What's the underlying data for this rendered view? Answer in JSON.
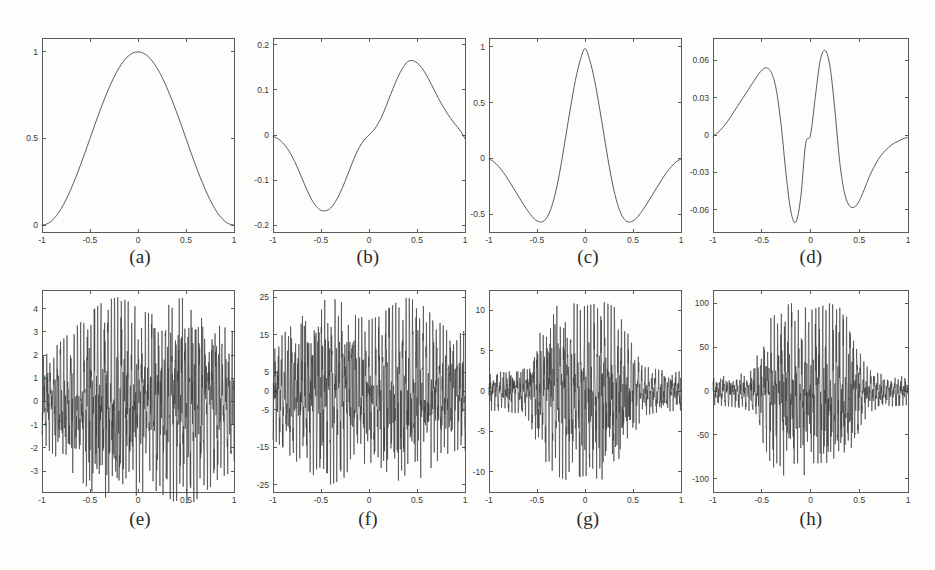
{
  "figure": {
    "background_color": "#fdfdfc",
    "axis_color": "#5a5a5a",
    "curve_color": "#4a4a4a",
    "noise_curve_color": "#3c3c3c"
  },
  "panels": [
    {
      "id": "a",
      "caption": "(a)"
    },
    {
      "id": "b",
      "caption": "(b)"
    },
    {
      "id": "c",
      "caption": "(c)"
    },
    {
      "id": "d",
      "caption": "(d)"
    },
    {
      "id": "e",
      "caption": "(e)"
    },
    {
      "id": "f",
      "caption": "(f)"
    },
    {
      "id": "g",
      "caption": "(g)"
    },
    {
      "id": "h",
      "caption": "(h)"
    }
  ],
  "chart_data": [
    {
      "panel": "a",
      "type": "line",
      "title": "(a)",
      "xlabel": "",
      "ylabel": "",
      "xlim": [
        -1,
        1
      ],
      "ylim": [
        -0.04,
        1.08
      ],
      "xticks": [
        -1,
        -0.5,
        0,
        0.5,
        1
      ],
      "xticklabels": [
        "-1",
        "-0.5",
        "0",
        "0.5",
        "1"
      ],
      "yticks": [
        0,
        0.5,
        1
      ],
      "yticklabels": [
        "0",
        "0.5",
        "1"
      ],
      "grid": false,
      "legend": null,
      "description": "smooth symmetric bell-shaped scaling function, value 0 at x=-1, rises to peak 1.0 at x=0, back to 0 at x=1",
      "x": [
        -1,
        -0.95,
        -0.9,
        -0.85,
        -0.8,
        -0.75,
        -0.7,
        -0.65,
        -0.6,
        -0.55,
        -0.5,
        -0.45,
        -0.4,
        -0.35,
        -0.3,
        -0.25,
        -0.2,
        -0.15,
        -0.1,
        -0.05,
        0,
        0.05,
        0.1,
        0.15,
        0.2,
        0.25,
        0.3,
        0.35,
        0.4,
        0.45,
        0.5,
        0.55,
        0.6,
        0.65,
        0.7,
        0.75,
        0.8,
        0.85,
        0.9,
        0.95,
        1
      ],
      "y": [
        0.0,
        0.006,
        0.024,
        0.054,
        0.095,
        0.146,
        0.206,
        0.273,
        0.345,
        0.421,
        0.5,
        0.579,
        0.655,
        0.727,
        0.794,
        0.854,
        0.905,
        0.946,
        0.976,
        0.994,
        1.0,
        0.994,
        0.976,
        0.946,
        0.905,
        0.854,
        0.794,
        0.727,
        0.655,
        0.579,
        0.5,
        0.421,
        0.345,
        0.273,
        0.206,
        0.146,
        0.095,
        0.054,
        0.024,
        0.006,
        0.0
      ]
    },
    {
      "panel": "b",
      "type": "line",
      "title": "(b)",
      "xlabel": "",
      "ylabel": "",
      "xlim": [
        -1,
        1
      ],
      "ylim": [
        -0.215,
        0.215
      ],
      "xticks": [
        -1,
        -0.5,
        0,
        0.5,
        1
      ],
      "xticklabels": [
        "-1",
        "-0.5",
        "0",
        "0.5",
        "1"
      ],
      "yticks": [
        -0.2,
        -0.1,
        0,
        0.1,
        0.2
      ],
      "yticklabels": [
        "-0.2",
        "-0.1",
        "0",
        "0.1",
        "0.2"
      ],
      "grid": false,
      "legend": null,
      "description": "odd antisymmetric wavelet-like function: 0 at x=-1, minimum about -0.168 near x=-0.35, zero crossing at x=0, maximum about 0.165 near x=0.35, decaying to about -0.01 at x=1",
      "x": [
        -1,
        -0.95,
        -0.9,
        -0.85,
        -0.8,
        -0.75,
        -0.7,
        -0.65,
        -0.6,
        -0.55,
        -0.5,
        -0.45,
        -0.4,
        -0.35,
        -0.3,
        -0.25,
        -0.2,
        -0.15,
        -0.1,
        -0.05,
        0,
        0.05,
        0.1,
        0.15,
        0.2,
        0.25,
        0.3,
        0.35,
        0.4,
        0.45,
        0.5,
        0.55,
        0.6,
        0.65,
        0.7,
        0.75,
        0.8,
        0.85,
        0.9,
        0.95,
        1
      ],
      "y": [
        -0.003,
        -0.008,
        -0.017,
        -0.03,
        -0.048,
        -0.07,
        -0.095,
        -0.12,
        -0.142,
        -0.158,
        -0.167,
        -0.168,
        -0.162,
        -0.148,
        -0.128,
        -0.103,
        -0.076,
        -0.049,
        -0.027,
        -0.011,
        0.0,
        0.011,
        0.027,
        0.049,
        0.076,
        0.103,
        0.128,
        0.148,
        0.162,
        0.165,
        0.16,
        0.149,
        0.132,
        0.112,
        0.091,
        0.071,
        0.053,
        0.037,
        0.023,
        0.01,
        -0.008
      ]
    },
    {
      "panel": "c",
      "type": "line",
      "title": "(c)",
      "xlabel": "",
      "ylabel": "",
      "xlim": [
        -1,
        1
      ],
      "ylim": [
        -0.66,
        1.08
      ],
      "xticks": [
        -1,
        -0.5,
        0,
        0.5,
        1
      ],
      "xticklabels": [
        "-1",
        "-0.5",
        "0",
        "0.5",
        "1"
      ],
      "yticks": [
        -0.5,
        0,
        0.5,
        1
      ],
      "yticklabels": [
        "-0.5",
        "0",
        "0.5",
        "1"
      ],
      "grid": false,
      "legend": null,
      "description": "even symmetric wavelet: 0 at x=-1, minimum about -0.57 at x=-0.45, peak 0.99 at x=0, minimum -0.57 at x=0.45, back to 0 at x=1",
      "x": [
        -1,
        -0.95,
        -0.9,
        -0.85,
        -0.8,
        -0.75,
        -0.7,
        -0.65,
        -0.6,
        -0.55,
        -0.5,
        -0.45,
        -0.4,
        -0.35,
        -0.3,
        -0.25,
        -0.2,
        -0.15,
        -0.1,
        -0.05,
        0,
        0.05,
        0.1,
        0.15,
        0.2,
        0.25,
        0.3,
        0.35,
        0.4,
        0.45,
        0.5,
        0.55,
        0.6,
        0.65,
        0.7,
        0.75,
        0.8,
        0.85,
        0.9,
        0.95,
        1
      ],
      "y": [
        -0.005,
        -0.03,
        -0.072,
        -0.126,
        -0.19,
        -0.26,
        -0.33,
        -0.4,
        -0.465,
        -0.523,
        -0.56,
        -0.57,
        -0.535,
        -0.44,
        -0.28,
        -0.06,
        0.2,
        0.46,
        0.7,
        0.88,
        0.985,
        0.88,
        0.7,
        0.46,
        0.2,
        -0.06,
        -0.28,
        -0.44,
        -0.535,
        -0.57,
        -0.56,
        -0.523,
        -0.465,
        -0.4,
        -0.33,
        -0.26,
        -0.19,
        -0.126,
        -0.072,
        -0.03,
        -0.005
      ]
    },
    {
      "panel": "d",
      "type": "line",
      "title": "(d)",
      "xlabel": "",
      "ylabel": "",
      "xlim": [
        -1,
        1
      ],
      "ylim": [
        -0.078,
        0.078
      ],
      "xticks": [
        -1,
        -0.5,
        0,
        0.5,
        1
      ],
      "xticklabels": [
        "-1",
        "-0.5",
        "0",
        "0.5",
        "1"
      ],
      "yticks": [
        -0.06,
        -0.03,
        0,
        0.03,
        0.06
      ],
      "yticklabels": [
        "-0.06",
        "-0.03",
        "0",
        "0.03",
        "0.06"
      ],
      "grid": false,
      "legend": null,
      "description": "odd higher-order wavelet: rises from 0 to local max 0.054 at x=-0.44, drops to minimum -0.070 at x=-0.14, rises to maximum 0.068 at x=0.16, drops to -0.058 at x=0.45, returns toward 0 at x=1",
      "x": [
        -1,
        -0.95,
        -0.9,
        -0.85,
        -0.8,
        -0.75,
        -0.7,
        -0.65,
        -0.6,
        -0.55,
        -0.5,
        -0.45,
        -0.4,
        -0.35,
        -0.3,
        -0.25,
        -0.2,
        -0.15,
        -0.1,
        -0.05,
        0,
        0.05,
        0.1,
        0.15,
        0.2,
        0.25,
        0.3,
        0.35,
        0.4,
        0.45,
        0.5,
        0.55,
        0.6,
        0.65,
        0.7,
        0.75,
        0.8,
        0.85,
        0.9,
        0.95,
        1
      ],
      "y": [
        -0.001,
        0.002,
        0.006,
        0.011,
        0.017,
        0.023,
        0.029,
        0.035,
        0.041,
        0.047,
        0.052,
        0.054,
        0.05,
        0.036,
        0.007,
        -0.032,
        -0.062,
        -0.07,
        -0.05,
        -0.007,
        0.0,
        0.031,
        0.06,
        0.068,
        0.055,
        0.02,
        -0.022,
        -0.047,
        -0.057,
        -0.058,
        -0.053,
        -0.044,
        -0.034,
        -0.026,
        -0.019,
        -0.014,
        -0.01,
        -0.007,
        -0.005,
        -0.003,
        -0.002
      ]
    },
    {
      "panel": "e",
      "type": "line",
      "title": "(e)",
      "xlabel": "",
      "ylabel": "",
      "xlim": [
        -1,
        1
      ],
      "ylim": [
        -3.9,
        4.8
      ],
      "xticks": [
        -1,
        -0.5,
        0,
        0.5,
        1
      ],
      "xticklabels": [
        "-1",
        "-0.5",
        "0",
        "0.5",
        "1"
      ],
      "yticks": [
        -3,
        -2,
        -1,
        0,
        1,
        2,
        3,
        4
      ],
      "yticklabels": [
        "-3",
        "-2",
        "-1",
        "0",
        "1",
        "2",
        "3",
        "4"
      ],
      "grid": false,
      "legend": null,
      "description": "dense high-frequency oscillatory signal (derivative/fine-scale detail), amplitude roughly uniform across the interval, extremes about -3.7 to 4.5",
      "envelope": [
        1.9,
        2.2,
        2.6,
        3.0,
        3.4,
        3.8,
        4.2,
        4.4,
        4.5,
        4.3,
        4.0,
        3.8,
        3.9,
        4.1,
        4.4,
        4.5,
        4.3,
        3.9,
        3.5,
        3.2,
        3.0
      ],
      "amplitude_max": 4.5,
      "amplitude_min": -3.7
    },
    {
      "panel": "f",
      "type": "line",
      "title": "(f)",
      "xlabel": "",
      "ylabel": "",
      "xlim": [
        -1,
        1
      ],
      "ylim": [
        -27,
        27
      ],
      "xticks": [
        -1,
        -0.5,
        0,
        0.5,
        1
      ],
      "xticklabels": [
        "-1",
        "-0.5",
        "0",
        "0.5",
        "1"
      ],
      "yticks": [
        -25,
        -15,
        -5,
        0,
        5,
        15,
        25
      ],
      "yticklabels": [
        "-25",
        "-15",
        "-5",
        "0",
        "5",
        "15",
        "25"
      ],
      "grid": false,
      "legend": null,
      "description": "dense high-frequency oscillatory signal, extremes about -25 to 25, amplitude roughly uniform with modest peaks near the centre",
      "envelope": [
        13,
        15,
        18,
        20,
        22,
        24,
        25,
        24,
        22,
        20,
        19,
        20,
        22,
        24,
        25,
        24,
        22,
        19,
        17,
        16,
        16
      ],
      "amplitude_max": 25,
      "amplitude_min": -25
    },
    {
      "panel": "g",
      "type": "line",
      "title": "(g)",
      "xlabel": "",
      "ylabel": "",
      "xlim": [
        -1,
        1
      ],
      "ylim": [
        -12.5,
        12.5
      ],
      "xticks": [
        -1,
        -0.5,
        0,
        0.5,
        1
      ],
      "xticklabels": [
        "-1",
        "-0.5",
        "0",
        "0.5",
        "1"
      ],
      "yticks": [
        -10,
        -5,
        0,
        5,
        10
      ],
      "yticklabels": [
        "-10",
        "-5",
        "0",
        "5",
        "10"
      ],
      "grid": false,
      "legend": null,
      "description": "dense high-frequency oscillatory signal with amplitude strongly concentrated near the centre, roughly +/-2.5 at the edges growing to about +/-11 between x=-0.45 and x=0.45",
      "envelope": [
        2.4,
        2.5,
        2.6,
        2.8,
        3.2,
        6.5,
        9.0,
        10.5,
        11.0,
        10.8,
        10.5,
        10.8,
        11.0,
        10.5,
        8.5,
        5.5,
        3.2,
        2.8,
        2.6,
        2.5,
        2.4
      ],
      "amplitude_max": 11.0,
      "amplitude_min": -11.0
    },
    {
      "panel": "h",
      "type": "line",
      "title": "(h)",
      "xlabel": "",
      "ylabel": "",
      "xlim": [
        -1,
        1
      ],
      "ylim": [
        -115,
        115
      ],
      "xticks": [
        -1,
        -0.5,
        0,
        0.5,
        1
      ],
      "xticklabels": [
        "-1",
        "-0.5",
        "0",
        "0.5",
        "1"
      ],
      "yticks": [
        -100,
        -50,
        0,
        50,
        100
      ],
      "yticklabels": [
        "-100",
        "-50",
        "0",
        "50",
        "100"
      ],
      "grid": false,
      "legend": null,
      "description": "dense high-frequency oscillatory signal with amplitude strongly concentrated near the centre, roughly +/-18 at the edges growing to about +/-100 between x=-0.45 and x=0.45",
      "envelope": [
        16,
        17,
        18,
        20,
        24,
        55,
        85,
        95,
        100,
        98,
        92,
        96,
        100,
        95,
        80,
        45,
        24,
        20,
        18,
        17,
        16
      ],
      "amplitude_max": 100,
      "amplitude_min": -100
    }
  ]
}
